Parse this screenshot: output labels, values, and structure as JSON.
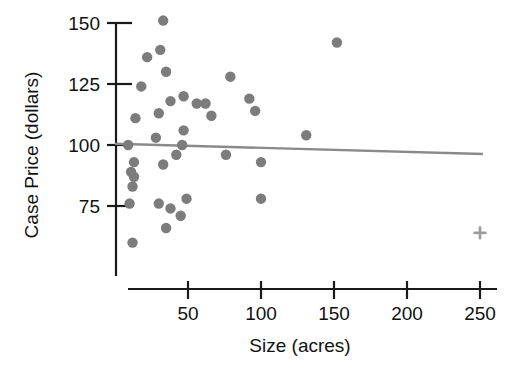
{
  "chart_data": {
    "type": "scatter",
    "title": "",
    "xlabel": "Size (acres)",
    "ylabel": "Case Price (dollars)",
    "xlim": [
      0,
      258
    ],
    "ylim": [
      55,
      157
    ],
    "xticks": [
      50,
      100,
      150,
      200,
      250
    ],
    "xtick_labels": [
      "50",
      "100",
      "150",
      "200",
      "250"
    ],
    "yticks": [
      75,
      100,
      125,
      150
    ],
    "ytick_labels": [
      "75",
      "100",
      "125",
      "150"
    ],
    "grid": false,
    "legend": null,
    "marker_color": "#7c7c7c",
    "line_color": "#8a8a8a",
    "axis_color": "#1a1a1a",
    "points": [
      {
        "x": 33,
        "y": 151
      },
      {
        "x": 31,
        "y": 139
      },
      {
        "x": 22,
        "y": 136
      },
      {
        "x": 35,
        "y": 130
      },
      {
        "x": 152,
        "y": 142
      },
      {
        "x": 79,
        "y": 128
      },
      {
        "x": 18,
        "y": 124
      },
      {
        "x": 47,
        "y": 120
      },
      {
        "x": 92,
        "y": 119
      },
      {
        "x": 38,
        "y": 118
      },
      {
        "x": 56,
        "y": 117
      },
      {
        "x": 62,
        "y": 117
      },
      {
        "x": 96,
        "y": 114
      },
      {
        "x": 30,
        "y": 113
      },
      {
        "x": 66,
        "y": 112
      },
      {
        "x": 14,
        "y": 111
      },
      {
        "x": 47,
        "y": 106
      },
      {
        "x": 28,
        "y": 103
      },
      {
        "x": 131,
        "y": 104
      },
      {
        "x": 9,
        "y": 100
      },
      {
        "x": 46,
        "y": 100
      },
      {
        "x": 42,
        "y": 96
      },
      {
        "x": 76,
        "y": 96
      },
      {
        "x": 13,
        "y": 93
      },
      {
        "x": 33,
        "y": 92
      },
      {
        "x": 100,
        "y": 93
      },
      {
        "x": 11,
        "y": 89
      },
      {
        "x": 13,
        "y": 87
      },
      {
        "x": 12,
        "y": 83
      },
      {
        "x": 100,
        "y": 78
      },
      {
        "x": 10,
        "y": 76
      },
      {
        "x": 30,
        "y": 76
      },
      {
        "x": 49,
        "y": 78
      },
      {
        "x": 38,
        "y": 74
      },
      {
        "x": 45,
        "y": 71
      },
      {
        "x": 35,
        "y": 66
      },
      {
        "x": 12,
        "y": 60
      }
    ],
    "outlier_marker": {
      "x": 250,
      "y": 64,
      "shape": "cross"
    },
    "fit_line": {
      "x0": 0,
      "y0": 100.5,
      "x1": 252,
      "y1": 96.3
    }
  }
}
